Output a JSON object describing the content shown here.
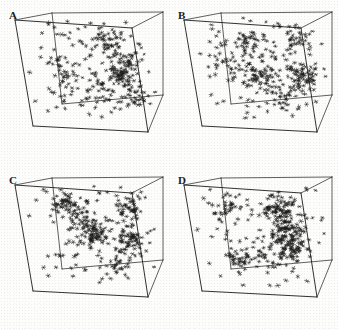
{
  "figure": {
    "name": "four-panel-3d-point-distribution",
    "background_color": "#fdfdfc",
    "ink_color": "#1a1a1a",
    "layout": {
      "rows": 2,
      "columns": 2,
      "panel_width": 169,
      "panel_height": 165
    }
  },
  "chart_data": {
    "type": "scatter",
    "title": "",
    "xlabel": "",
    "ylabel": "",
    "projection": "3d-perspective-cube",
    "marker": "jack-star",
    "marker_color": "#1a1a1a",
    "grid": false,
    "legend_position": "none",
    "axis_ranges": {
      "x": [
        0,
        1
      ],
      "y": [
        0,
        1
      ],
      "z": [
        0,
        1
      ]
    },
    "cube_geometry": {
      "front_top_left": [
        15,
        20
      ],
      "front_top_right": [
        132,
        28
      ],
      "back_top_left": [
        52,
        13
      ],
      "back_top_right": [
        163,
        12
      ],
      "front_bot_left": [
        33,
        126
      ],
      "front_bot_right": [
        148,
        132
      ],
      "back_bot_left": [
        62,
        104
      ],
      "back_bot_right": [
        163,
        95
      ],
      "bottom_front_vertex": [
        105,
        155
      ]
    },
    "panels": [
      {
        "label": "A",
        "label_x": 9,
        "label_y": 10,
        "point_count": 340,
        "seed": 11,
        "clusters": [
          {
            "cx": 0.62,
            "cy": 0.26,
            "cz": 0.48,
            "n": 46,
            "spread": 0.075
          },
          {
            "cx": 0.7,
            "cy": 0.6,
            "cz": 0.52,
            "n": 52,
            "spread": 0.08
          },
          {
            "cx": 0.24,
            "cy": 0.52,
            "cz": 0.4,
            "n": 34,
            "spread": 0.09
          },
          {
            "cx": 0.86,
            "cy": 0.42,
            "cz": 0.3,
            "n": 30,
            "spread": 0.07
          },
          {
            "cx": 0.5,
            "cy": 0.8,
            "cz": 0.62,
            "n": 28,
            "spread": 0.085
          },
          {
            "cx": 0.8,
            "cy": 0.86,
            "cz": 0.7,
            "n": 26,
            "spread": 0.07
          }
        ],
        "uniform_fraction": 0.3
      },
      {
        "label": "B",
        "label_x": 9,
        "label_y": 10,
        "point_count": 360,
        "seed": 23,
        "clusters": [
          {
            "cx": 0.38,
            "cy": 0.3,
            "cz": 0.45,
            "n": 44,
            "spread": 0.075
          },
          {
            "cx": 0.46,
            "cy": 0.6,
            "cz": 0.5,
            "n": 50,
            "spread": 0.07
          },
          {
            "cx": 0.84,
            "cy": 0.58,
            "cz": 0.4,
            "n": 56,
            "spread": 0.065
          },
          {
            "cx": 0.8,
            "cy": 0.2,
            "cz": 0.55,
            "n": 36,
            "spread": 0.08
          },
          {
            "cx": 0.2,
            "cy": 0.45,
            "cz": 0.35,
            "n": 26,
            "spread": 0.09
          },
          {
            "cx": 0.6,
            "cy": 0.84,
            "cz": 0.6,
            "n": 30,
            "spread": 0.08
          }
        ],
        "uniform_fraction": 0.28
      },
      {
        "label": "C",
        "label_x": 9,
        "label_y": 10,
        "point_count": 380,
        "seed": 37,
        "clusters": [
          {
            "cx": 0.48,
            "cy": 0.52,
            "cz": 0.48,
            "n": 70,
            "spread": 0.065
          },
          {
            "cx": 0.26,
            "cy": 0.22,
            "cz": 0.52,
            "n": 46,
            "spread": 0.06
          },
          {
            "cx": 0.82,
            "cy": 0.24,
            "cz": 0.44,
            "n": 42,
            "spread": 0.06
          },
          {
            "cx": 0.8,
            "cy": 0.56,
            "cz": 0.42,
            "n": 50,
            "spread": 0.065
          },
          {
            "cx": 0.38,
            "cy": 0.36,
            "cz": 0.45,
            "n": 34,
            "spread": 0.075
          },
          {
            "cx": 0.66,
            "cy": 0.88,
            "cz": 0.58,
            "n": 30,
            "spread": 0.07
          }
        ],
        "uniform_fraction": 0.25
      },
      {
        "label": "D",
        "label_x": 9,
        "label_y": 10,
        "point_count": 400,
        "seed": 53,
        "clusters": [
          {
            "cx": 0.66,
            "cy": 0.26,
            "cz": 0.46,
            "n": 74,
            "spread": 0.07
          },
          {
            "cx": 0.7,
            "cy": 0.52,
            "cz": 0.44,
            "n": 86,
            "spread": 0.065
          },
          {
            "cx": 0.72,
            "cy": 0.7,
            "cz": 0.5,
            "n": 48,
            "spread": 0.06
          },
          {
            "cx": 0.18,
            "cy": 0.24,
            "cz": 0.5,
            "n": 32,
            "spread": 0.07
          },
          {
            "cx": 0.22,
            "cy": 0.78,
            "cz": 0.55,
            "n": 36,
            "spread": 0.07
          },
          {
            "cx": 0.44,
            "cy": 0.74,
            "cz": 0.58,
            "n": 26,
            "spread": 0.075
          }
        ],
        "uniform_fraction": 0.22
      }
    ]
  }
}
